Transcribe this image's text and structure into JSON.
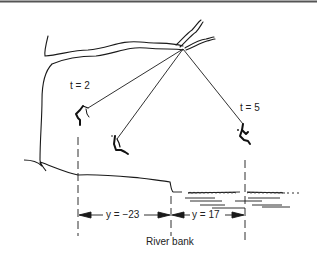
{
  "diagram": {
    "title": "",
    "labels": {
      "time_left": "t = 2",
      "time_right": "t = 5",
      "displacement_left": "y = −23",
      "displacement_right": "y = 17",
      "reference": "River bank"
    },
    "positions": [
      {
        "name": "swinger-at-t2",
        "time": 2
      },
      {
        "name": "swinger-middle"
      },
      {
        "name": "swinger-at-t5",
        "time": 5
      }
    ],
    "measurements": [
      {
        "variable": "y",
        "value": -23,
        "side": "left of river bank"
      },
      {
        "variable": "y",
        "value": 17,
        "side": "right of river bank"
      }
    ],
    "colors": {
      "ink": "#1a1a1a",
      "background": "#ffffff",
      "top_rule": "#555555"
    }
  }
}
